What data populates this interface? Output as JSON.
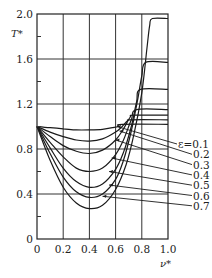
{
  "chart_data": {
    "type": "line",
    "title": "",
    "xlabel": "ν*",
    "ylabel": "T*",
    "xlim": [
      0,
      1.0
    ],
    "ylim": [
      0,
      2.0
    ],
    "grid": true,
    "x_ticks": [
      "0",
      "0.2",
      "0.4",
      "0.6",
      "0.8",
      "1.0"
    ],
    "x_tick_values": [
      0,
      0.2,
      0.4,
      0.6,
      0.8,
      1.0
    ],
    "y_ticks": [
      "0",
      "0.4",
      "0.8",
      "1.2",
      "1.6",
      "2.0"
    ],
    "y_tick_values": [
      0,
      0.4,
      0.8,
      1.2,
      1.6,
      2.0
    ],
    "y_minor_ticks": [
      0.2,
      0.6,
      1.0,
      1.4,
      1.8
    ],
    "legend_placement": "right",
    "legend_prefix": "ε",
    "series": [
      {
        "name": "ε=0.1",
        "label": "ε=0.1",
        "x": [
          0,
          0.1,
          0.2,
          0.3,
          0.4,
          0.5,
          0.58,
          0.62,
          0.65,
          1.0
        ],
        "y": [
          1.0,
          0.99,
          0.98,
          0.97,
          0.97,
          0.975,
          0.99,
          1.0,
          1.02,
          1.02
        ]
      },
      {
        "name": "ε=0.2",
        "label": "0.2",
        "x": [
          0,
          0.1,
          0.2,
          0.3,
          0.4,
          0.5,
          0.6,
          0.65,
          0.69,
          0.72,
          1.0
        ],
        "y": [
          1.0,
          0.95,
          0.91,
          0.88,
          0.87,
          0.89,
          0.95,
          1.0,
          1.05,
          1.06,
          1.06
        ]
      },
      {
        "name": "ε=0.3",
        "label": "0.3",
        "x": [
          0,
          0.1,
          0.2,
          0.3,
          0.4,
          0.5,
          0.6,
          0.66,
          0.71,
          0.74,
          1.0
        ],
        "y": [
          1.0,
          0.91,
          0.83,
          0.78,
          0.76,
          0.79,
          0.88,
          0.98,
          1.08,
          1.1,
          1.1
        ]
      },
      {
        "name": "ε=0.4",
        "label": "0.4",
        "x": [
          0,
          0.1,
          0.2,
          0.3,
          0.4,
          0.5,
          0.6,
          0.66,
          0.72,
          0.76,
          1.0
        ],
        "y": [
          1.0,
          0.86,
          0.73,
          0.63,
          0.6,
          0.63,
          0.75,
          0.88,
          1.06,
          1.15,
          1.15
        ]
      },
      {
        "name": "ε=0.5",
        "label": "0.5",
        "x": [
          0,
          0.1,
          0.2,
          0.3,
          0.4,
          0.5,
          0.6,
          0.66,
          0.72,
          0.76,
          0.79,
          1.0
        ],
        "y": [
          1.0,
          0.81,
          0.63,
          0.51,
          0.46,
          0.49,
          0.62,
          0.77,
          1.0,
          1.22,
          1.33,
          1.33
        ]
      },
      {
        "name": "ε=0.6",
        "label": "0.6",
        "x": [
          0,
          0.1,
          0.2,
          0.3,
          0.4,
          0.5,
          0.6,
          0.66,
          0.72,
          0.77,
          0.8,
          0.83,
          1.0
        ],
        "y": [
          1.0,
          0.76,
          0.55,
          0.42,
          0.37,
          0.4,
          0.53,
          0.7,
          0.96,
          1.25,
          1.45,
          1.57,
          1.57
        ]
      },
      {
        "name": "ε=0.7",
        "label": "0.7",
        "x": [
          0,
          0.1,
          0.2,
          0.3,
          0.4,
          0.5,
          0.6,
          0.68,
          0.74,
          0.8,
          0.84,
          0.86,
          0.88,
          1.0
        ],
        "y": [
          1.0,
          0.7,
          0.46,
          0.32,
          0.27,
          0.3,
          0.44,
          0.66,
          0.93,
          1.3,
          1.7,
          1.9,
          1.96,
          1.96
        ]
      }
    ],
    "leader_targets": [
      {
        "label": "ε=0.1",
        "x": 0.61,
        "y": 1.0
      },
      {
        "label": "0.2",
        "x": 0.63,
        "y": 0.96
      },
      {
        "label": "0.3",
        "x": 0.6,
        "y": 0.88
      },
      {
        "label": "0.4",
        "x": 0.57,
        "y": 0.72
      },
      {
        "label": "0.5",
        "x": 0.55,
        "y": 0.6
      },
      {
        "label": "0.6",
        "x": 0.55,
        "y": 0.48
      },
      {
        "label": "0.7",
        "x": 0.5,
        "y": 0.38
      }
    ]
  }
}
